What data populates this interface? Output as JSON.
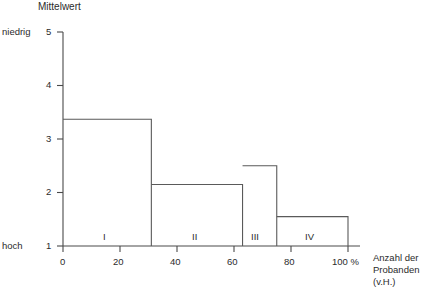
{
  "chart_data": {
    "type": "bar",
    "title": "",
    "ylabel": "Mittelwert",
    "xlabel": "Anzahl der Probanden (v.H.)",
    "xlabel_lines": [
      "Anzahl der",
      "Probanden",
      "(v.H.)"
    ],
    "categories": [
      "I",
      "II",
      "III",
      "IV"
    ],
    "values": [
      3.37,
      2.15,
      2.5,
      1.55
    ],
    "x_segments": [
      {
        "label": "I",
        "start": 0,
        "end": 31,
        "value": 3.37
      },
      {
        "label": "II",
        "start": 31,
        "end": 63,
        "value": 2.15
      },
      {
        "label": "III",
        "start": 63,
        "end": 75,
        "value": 2.5
      },
      {
        "label": "IV",
        "start": 75,
        "end": 100,
        "value": 1.55
      }
    ],
    "xlim": [
      0,
      100
    ],
    "ylim": [
      1,
      5
    ],
    "x_ticks": [
      0,
      20,
      40,
      60,
      80,
      100
    ],
    "x_tick_labels": [
      "0",
      "20",
      "40",
      "60",
      "80",
      "100 %"
    ],
    "y_ticks": [
      1,
      2,
      3,
      4,
      5
    ],
    "y_tick_labels": [
      "1",
      "2",
      "3",
      "4",
      "5"
    ],
    "y_axis_top_note": "niedrig",
    "y_axis_bottom_note": "hoch",
    "grid": false,
    "legend": "none"
  },
  "labels": {
    "y_title": "Mittelwert",
    "niedrig": "niedrig",
    "hoch": "hoch",
    "x_title_line1": "Anzahl der",
    "x_title_line2": "Probanden",
    "x_title_line3": "(v.H.)",
    "y5": "5",
    "y4": "4",
    "y3": "3",
    "y2": "2",
    "y1": "1",
    "x0": "0",
    "x20": "20",
    "x40": "40",
    "x60": "60",
    "x80": "80",
    "x100": "100 %",
    "seg1": "I",
    "seg2": "II",
    "seg3": "III",
    "seg4": "IV"
  },
  "colors": {
    "axis": "#4a4a4a",
    "bar_stroke": "#5a5a5a",
    "text": "#2b2b2b",
    "background": "#ffffff"
  }
}
